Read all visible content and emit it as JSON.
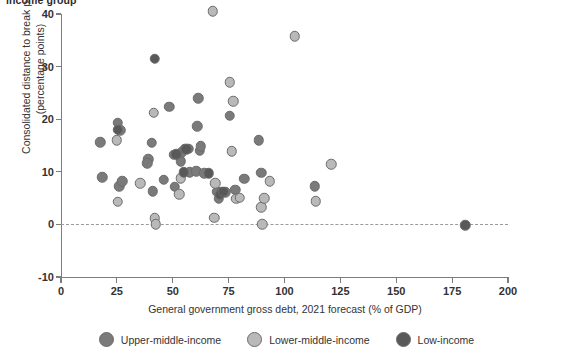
{
  "figure": {
    "title_partial": "income group"
  },
  "axes": {
    "y": {
      "title_line1": "Consolidated distance to break point",
      "title_line2": "(percentage points)",
      "ticks": [
        "40",
        "30",
        "20",
        "10",
        "0",
        "-10"
      ],
      "min": -10,
      "max": 40
    },
    "x": {
      "title": "General government gross debt, 2021 forecast (% of GDP)",
      "ticks": [
        "0",
        "25",
        "50",
        "75",
        "100",
        "125",
        "150",
        "175",
        "200"
      ],
      "min": 0,
      "max": 200
    }
  },
  "legend": {
    "items": [
      {
        "label": "Upper-middle-income",
        "color": "#7a7a7a",
        "key": "upper"
      },
      {
        "label": "Lower-middle-income",
        "color": "#b9b9b9",
        "key": "lower"
      },
      {
        "label": "Low-income",
        "color": "#595959",
        "key": "low"
      }
    ]
  },
  "colors": {
    "upper_middle_income": "#7a7a7a",
    "lower_middle_income": "#b9b9b9",
    "low_income": "#595959",
    "marker_stroke": "#6b6b6b",
    "axis": "#7d7d7d",
    "zero_line": "#9a9a9a",
    "text": "#333333",
    "background": "#ffffff"
  },
  "chart_data": {
    "type": "scatter",
    "title": "income group",
    "xlabel": "General government gross debt, 2021 forecast (% of GDP)",
    "ylabel": "Consolidated distance to break point (percentage points)",
    "xlim": [
      0,
      200
    ],
    "ylim": [
      -10,
      40
    ],
    "xticks": [
      0,
      25,
      50,
      75,
      100,
      125,
      150,
      175,
      200
    ],
    "yticks": [
      -10,
      0,
      10,
      20,
      30,
      40
    ],
    "grid": false,
    "legend_position": "bottom",
    "reference_lines": [
      {
        "axis": "y",
        "value": 0,
        "style": "dashed"
      }
    ],
    "series": [
      {
        "name": "Upper-middle-income",
        "color": "#7a7a7a",
        "points": [
          [
            17.5,
            15.6
          ],
          [
            18.5,
            9.0
          ],
          [
            25.5,
            19.3
          ],
          [
            26.5,
            17.9
          ],
          [
            26.0,
            7.3
          ],
          [
            27.5,
            8.2
          ],
          [
            39.0,
            12.4
          ],
          [
            38.5,
            11.6
          ],
          [
            40.5,
            15.5
          ],
          [
            41.0,
            6.3
          ],
          [
            46.0,
            8.5
          ],
          [
            48.5,
            22.4
          ],
          [
            50.5,
            13.2
          ],
          [
            51.0,
            7.2
          ],
          [
            53.5,
            12.0
          ],
          [
            54.0,
            13.7
          ],
          [
            55.5,
            14.4
          ],
          [
            57.5,
            9.9
          ],
          [
            57.0,
            14.4
          ],
          [
            61.5,
            24.0
          ],
          [
            61.0,
            18.7
          ],
          [
            62.0,
            14.0
          ],
          [
            62.5,
            14.9
          ],
          [
            60.5,
            10.1
          ],
          [
            64.0,
            9.7
          ],
          [
            70.0,
            6.2
          ],
          [
            70.5,
            4.9
          ],
          [
            72.0,
            6.2
          ],
          [
            73.5,
            6.1
          ],
          [
            75.5,
            20.7
          ],
          [
            78.0,
            6.6
          ],
          [
            82.0,
            8.7
          ],
          [
            88.5,
            16.0
          ],
          [
            89.5,
            9.8
          ],
          [
            113.5,
            7.3
          ]
        ]
      },
      {
        "name": "Lower-middle-income",
        "color": "#b9b9b9",
        "points": [
          [
            25.0,
            16.0
          ],
          [
            25.5,
            4.3
          ],
          [
            35.5,
            7.8
          ],
          [
            41.5,
            21.2
          ],
          [
            42.0,
            1.2
          ],
          [
            42.5,
            0.0
          ],
          [
            53.0,
            5.7
          ],
          [
            53.5,
            8.8
          ],
          [
            68.0,
            40.5
          ],
          [
            68.5,
            1.3
          ],
          [
            69.0,
            7.8
          ],
          [
            75.5,
            27.0
          ],
          [
            77.0,
            23.4
          ],
          [
            76.5,
            13.9
          ],
          [
            78.5,
            4.9
          ],
          [
            80.0,
            5.1
          ],
          [
            89.5,
            3.3
          ],
          [
            90.0,
            0.0
          ],
          [
            91.0,
            5.0
          ],
          [
            93.5,
            8.2
          ],
          [
            104.5,
            35.8
          ],
          [
            114.0,
            4.4
          ],
          [
            121.0,
            11.4
          ]
        ]
      },
      {
        "name": "Low-income",
        "color": "#595959",
        "points": [
          [
            25.5,
            18.0
          ],
          [
            42.0,
            31.5
          ],
          [
            51.5,
            13.3
          ],
          [
            55.0,
            9.9
          ],
          [
            56.0,
            14.3
          ],
          [
            66.0,
            9.7
          ],
          [
            71.0,
            5.6
          ],
          [
            72.5,
            6.2
          ],
          [
            180.8,
            -0.2
          ]
        ]
      }
    ]
  }
}
